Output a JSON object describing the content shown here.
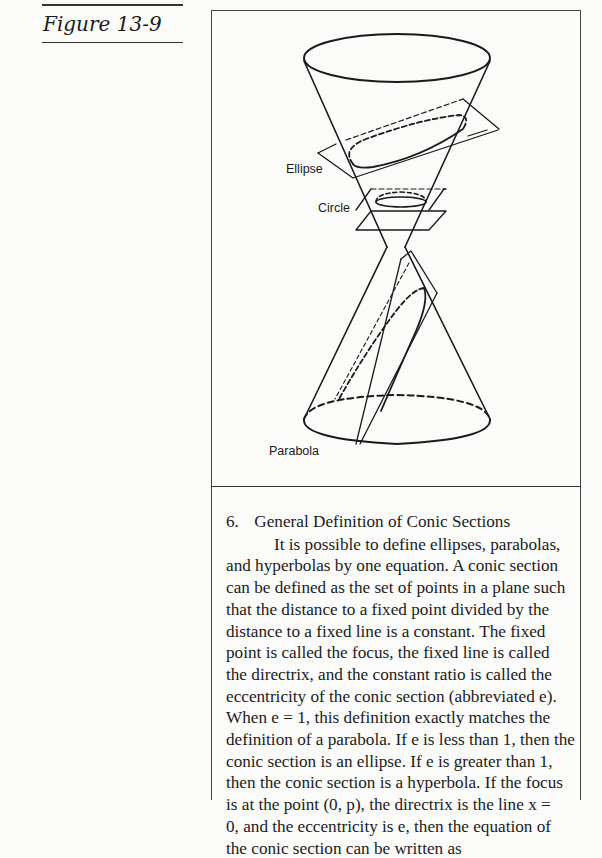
{
  "figure": {
    "label": "Figure 13-9",
    "diagram_labels": {
      "ellipse": "Ellipse",
      "circle": "Circle",
      "parabola": "Parabola"
    }
  },
  "section": {
    "number": "6.",
    "title": "General Definition of Conic Sections",
    "lines": [
      "It is possible to define ellipses, parabolas,",
      "and hyperbolas by one equation. A conic section",
      "can be defined as the set of points in a plane such",
      "that the distance to a fixed point divided by the",
      "distance to a fixed line is a constant. The fixed",
      "point is called the focus, the fixed line is called",
      "the directrix, and the constant ratio is called the",
      "eccentricity of the conic section (abbreviated e).",
      "When e = 1, this definition exactly matches the",
      "definition of a parabola. If e is less than 1, then the",
      "conic section is an ellipse. If e is greater than 1,",
      "then the conic section is a hyperbola. If the focus",
      "is at the point (0, p), the directrix is the line x =",
      "0, and the eccentricity is e, then the equation of",
      "the conic section can be written as"
    ]
  }
}
